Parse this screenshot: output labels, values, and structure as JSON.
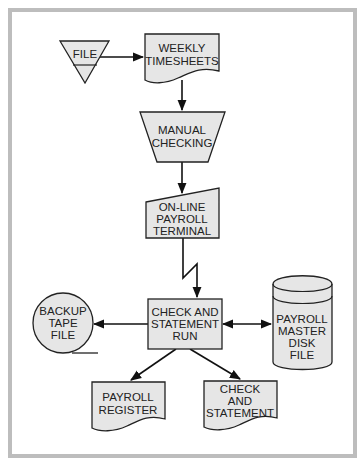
{
  "diagram": {
    "type": "flowchart",
    "title": "",
    "colors": {
      "shape_fill": "#e6e6e6",
      "stroke": "#222222",
      "frame": "#bdbdbd",
      "background": "#ffffff"
    },
    "nodes": {
      "file": {
        "shape": "offline-storage-triangle",
        "lines": [
          "FILE"
        ]
      },
      "weekly_timesheets": {
        "shape": "document",
        "lines": [
          "WEEKLY",
          "TIMESHEETS"
        ]
      },
      "manual_checking": {
        "shape": "manual-operation-trapezoid",
        "lines": [
          "MANUAL",
          "CHECKING"
        ]
      },
      "online_terminal": {
        "shape": "manual-input",
        "lines": [
          "ON-LINE",
          "PAYROLL",
          "TERMINAL"
        ]
      },
      "check_run": {
        "shape": "process",
        "lines": [
          "CHECK AND",
          "STATEMENT",
          "RUN"
        ]
      },
      "backup_tape": {
        "shape": "magnetic-tape",
        "lines": [
          "BACKUP",
          "TAPE",
          "FILE"
        ]
      },
      "master_disk": {
        "shape": "magnetic-disk",
        "lines": [
          "PAYROLL",
          "MASTER",
          "DISK",
          "FILE"
        ]
      },
      "payroll_register": {
        "shape": "document",
        "lines": [
          "PAYROLL",
          "REGISTER"
        ]
      },
      "check_statement": {
        "shape": "document",
        "lines": [
          "CHECK",
          "AND",
          "STATEMENT"
        ]
      }
    },
    "edges": [
      {
        "from": "file",
        "to": "weekly_timesheets",
        "style": "arrow"
      },
      {
        "from": "weekly_timesheets",
        "to": "manual_checking",
        "style": "arrow"
      },
      {
        "from": "manual_checking",
        "to": "online_terminal",
        "style": "arrow"
      },
      {
        "from": "online_terminal",
        "to": "check_run",
        "style": "communication-link"
      },
      {
        "from": "check_run",
        "to": "backup_tape",
        "style": "arrow"
      },
      {
        "from": "check_run",
        "to": "master_disk",
        "style": "bidirectional-arrow"
      },
      {
        "from": "check_run",
        "to": "payroll_register",
        "style": "arrow"
      },
      {
        "from": "check_run",
        "to": "check_statement",
        "style": "arrow"
      }
    ]
  }
}
